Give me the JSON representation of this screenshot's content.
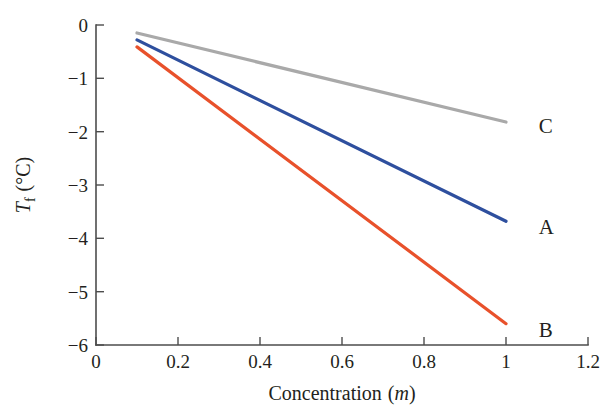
{
  "chart_data": {
    "type": "line",
    "title": "",
    "xlabel": "Concentration (m)",
    "xlabel_plain": "Concentration",
    "xlabel_unit": "m",
    "ylabel": "Tf (°C)",
    "ylabel_symbol": "T",
    "ylabel_subscript": "f",
    "ylabel_unit": "(°C)",
    "xlim": [
      0,
      1.2
    ],
    "ylim": [
      -6,
      0
    ],
    "xticks": [
      0,
      0.2,
      0.4,
      0.6,
      0.8,
      1,
      1.2
    ],
    "xtick_labels": [
      "0",
      "0.2",
      "0.4",
      "0.6",
      "0.8",
      "1",
      "1.2"
    ],
    "yticks": [
      0,
      -1,
      -2,
      -3,
      -4,
      -5,
      -6
    ],
    "ytick_labels": [
      "0",
      "−1",
      "−2",
      "−3",
      "−4",
      "−5",
      "−6"
    ],
    "grid": false,
    "legend_position": "inline-right-of-line-end",
    "x": [
      0.1,
      1.0
    ],
    "series": [
      {
        "name": "C",
        "label": "C",
        "color": "#a9a9a9",
        "values": [
          -0.15,
          -1.82
        ],
        "label_x": 1.08,
        "label_y": -1.9
      },
      {
        "name": "A",
        "label": "A",
        "color": "#2e4f9e",
        "values": [
          -0.28,
          -3.68
        ],
        "label_x": 1.08,
        "label_y": -3.78
      },
      {
        "name": "B",
        "label": "B",
        "color": "#e8512b",
        "values": [
          -0.41,
          -5.6
        ],
        "label_x": 1.08,
        "label_y": -5.72
      }
    ]
  },
  "axis": {
    "line_color": "#4d4d4d",
    "tick_direction": "inward"
  },
  "background": {
    "color": "#ffffff"
  }
}
